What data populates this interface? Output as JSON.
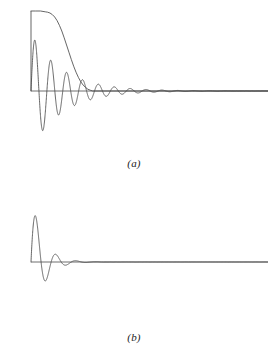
{
  "figure": {
    "background_color": "#ffffff",
    "line_color": "#4a4a4a",
    "axis_color": "#6e6e6e",
    "caption_color": "#1a1a1a",
    "width": 268,
    "height": 352
  },
  "panels": [
    {
      "id": "a",
      "caption": "(a)",
      "baseline_y": 91,
      "x_start": 31,
      "x_end": 268
    },
    {
      "id": "b",
      "caption": "(b)",
      "baseline_y": 86,
      "x_start": 31,
      "x_end": 268
    }
  ],
  "chart_data": {
    "type": "line",
    "title": "",
    "subtitle": "",
    "xlabel": "",
    "ylabel": "",
    "grid": false,
    "legend_position": "none",
    "panel_count": 2,
    "panels": [
      {
        "id": "a",
        "caption": "(a)",
        "xlim": [
          0,
          100
        ],
        "ylim": [
          -1.35,
          1.0
        ],
        "axis": {
          "baseline_value": 0,
          "baseline_drawn": true,
          "x_axis_start": 0,
          "x_axis_end": 100
        },
        "series": [
          {
            "name": "envelope",
            "description": "smooth slowly-decaying envelope, flat near 1.0 then sigmoid decay to 0",
            "x": [
              0,
              2,
              4,
              6,
              7,
              8,
              9,
              10,
              11,
              12,
              13,
              14,
              15,
              16,
              17,
              18,
              19,
              20,
              21,
              22,
              23,
              24,
              25,
              26,
              100
            ],
            "y": [
              1.0,
              1.0,
              1.0,
              0.99,
              0.985,
              0.975,
              0.955,
              0.925,
              0.88,
              0.82,
              0.75,
              0.665,
              0.575,
              0.485,
              0.395,
              0.31,
              0.235,
              0.17,
              0.115,
              0.075,
              0.045,
              0.022,
              0.01,
              0.0,
              0.0
            ]
          },
          {
            "name": "damped-oscillation",
            "description": "damped sinusoid, slow decay, period approximately 6.7 x-units",
            "amplitude_initial": 0.72,
            "decay_rate": 0.075,
            "period": 6.7,
            "phase_deg": 0,
            "peaks_y": [
              0.72,
              0.44,
              0.27,
              0.165,
              0.1,
              0.062,
              0.038,
              0.023,
              0.014
            ],
            "troughs_y": [
              -1.3,
              -0.57,
              -0.35,
              -0.215,
              -0.13,
              -0.08,
              -0.05,
              -0.03,
              -0.018
            ]
          }
        ]
      },
      {
        "id": "b",
        "caption": "(b)",
        "xlim": [
          0,
          100
        ],
        "ylim": [
          -1.35,
          1.0
        ],
        "axis": {
          "baseline_value": 0,
          "baseline_drawn": true,
          "x_axis_start": 0,
          "x_axis_end": 100
        },
        "series": [
          {
            "name": "damped-oscillation",
            "description": "damped sinusoid, rapid decay, period approximately 8.5 x-units",
            "amplitude_initial": 0.87,
            "decay_rate": 0.21,
            "period": 8.5,
            "phase_deg": 0,
            "peaks_y": [
              0.87,
              0.44,
              0.205,
              0.055
            ],
            "troughs_y": [
              -1.28,
              -0.6,
              -0.28,
              -0.075
            ]
          }
        ]
      }
    ]
  }
}
